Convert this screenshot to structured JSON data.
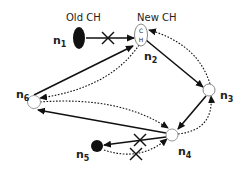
{
  "labels": {
    "old_ch": "Old CH",
    "new_ch": "New CH",
    "ch_top": "C",
    "ch_bottom": "H",
    "n1": "n",
    "n1_sub": "1",
    "n2": "n",
    "n2_sub": "2",
    "n3": "n",
    "n3_sub": "3",
    "n4": "n",
    "n4_sub": "4",
    "n5": "n",
    "n5_sub": "5",
    "n6": "n",
    "n6_sub": "6"
  },
  "nodes": [
    {
      "id": "n1",
      "type": "filled",
      "role": "Old CH"
    },
    {
      "id": "n2",
      "type": "hollow",
      "role": "New CH"
    },
    {
      "id": "n3",
      "type": "hollow"
    },
    {
      "id": "n4",
      "type": "hollow"
    },
    {
      "id": "n5",
      "type": "filled"
    },
    {
      "id": "n6",
      "type": "hollow"
    }
  ],
  "edges": [
    {
      "from": "n1",
      "to": "n2",
      "style": "solid",
      "broken": true
    },
    {
      "from": "n2",
      "to": "n3",
      "style": "solid"
    },
    {
      "from": "n3",
      "to": "n4",
      "style": "solid"
    },
    {
      "from": "n4",
      "to": "n6",
      "style": "solid"
    },
    {
      "from": "n6",
      "to": "n2",
      "style": "solid"
    },
    {
      "from": "n4",
      "to": "n5",
      "style": "solid",
      "broken": true
    },
    {
      "from": "n3",
      "to": "n2",
      "style": "dotted"
    },
    {
      "from": "n2",
      "to": "n6",
      "style": "dotted"
    },
    {
      "from": "n6",
      "to": "n4",
      "style": "dotted"
    },
    {
      "from": "n4",
      "to": "n3",
      "style": "dotted"
    },
    {
      "from": "n5",
      "to": "n4",
      "style": "dotted",
      "broken": true
    }
  ]
}
